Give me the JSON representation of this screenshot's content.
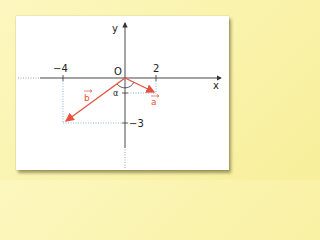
{
  "diagram": {
    "axes": {
      "x_label": "x",
      "y_label": "y",
      "origin_label": "O",
      "tick_labels": {
        "x_neg": "−4",
        "x_pos": "2",
        "y_neg": "−3"
      }
    },
    "vectors": [
      {
        "name": "a",
        "label": "a",
        "from": [
          0,
          0
        ],
        "to": [
          2,
          -1
        ]
      },
      {
        "name": "b",
        "label": "b",
        "from": [
          0,
          0
        ],
        "to": [
          -4,
          -3
        ]
      }
    ],
    "angle_label": "α",
    "colors": {
      "background": "#fbf4b0",
      "panel": "#ffffff",
      "axes": "#333333",
      "vector": "#e8513f",
      "guide": "#6aa8c8"
    }
  }
}
